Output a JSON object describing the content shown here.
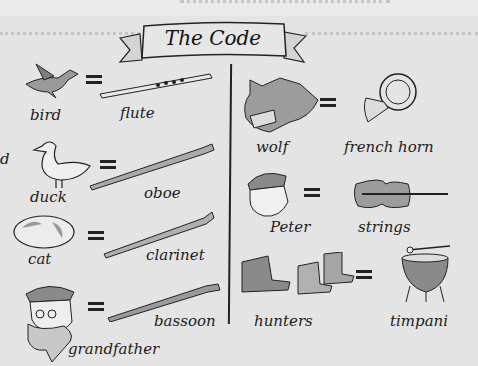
{
  "title": "The Code",
  "edge_fragment": "d",
  "left_column": [
    {
      "character": "bird",
      "instrument": "flute",
      "character_icon": "bird-icon",
      "instrument_icon": "flute-icon"
    },
    {
      "character": "duck",
      "instrument": "oboe",
      "character_icon": "duck-icon",
      "instrument_icon": "oboe-icon"
    },
    {
      "character": "cat",
      "instrument": "clarinet",
      "character_icon": "cat-icon",
      "instrument_icon": "clarinet-icon"
    },
    {
      "character": "grandfather",
      "instrument": "bassoon",
      "character_icon": "grandfather-icon",
      "instrument_icon": "bassoon-icon"
    }
  ],
  "right_column": [
    {
      "character": "wolf",
      "instrument": "french horn",
      "character_icon": "wolf-icon",
      "instrument_icon": "french-horn-icon"
    },
    {
      "character": "Peter",
      "instrument": "strings",
      "character_icon": "peter-icon",
      "instrument_icon": "violin-icon"
    },
    {
      "character": "hunters",
      "instrument": "timpani",
      "character_icon": "hunters-boots-icon",
      "instrument_icon": "timpani-icon"
    }
  ],
  "equals_sign": "=",
  "colors": {
    "background": "#e4e4e4",
    "ink": "#1a1a1a",
    "wash_gray": "#9a9a9a"
  }
}
